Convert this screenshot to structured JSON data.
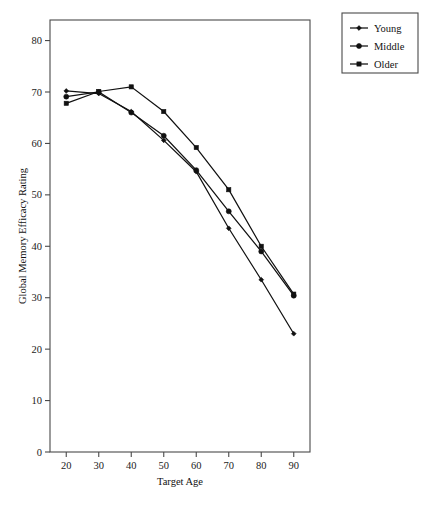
{
  "chart_data": {
    "type": "line",
    "title": "",
    "xlabel": "Target Age",
    "ylabel": "Global Memory Efficacy Rating",
    "x": [
      20,
      30,
      40,
      50,
      60,
      70,
      80,
      90
    ],
    "xlim": [
      15,
      95
    ],
    "ylim": [
      0,
      84
    ],
    "xticks": [
      "20",
      "30",
      "40",
      "50",
      "60",
      "70",
      "80",
      "90"
    ],
    "yticks": [
      "0",
      "10",
      "20",
      "30",
      "40",
      "50",
      "60",
      "70",
      "80"
    ],
    "ytick_values": [
      0,
      10,
      20,
      30,
      40,
      50,
      60,
      70,
      80
    ],
    "grid": false,
    "legend_position": "outside-top-right",
    "series": [
      {
        "name": "Young",
        "marker": "diamond",
        "color": "#111111",
        "values": [
          70.2,
          69.7,
          66.2,
          60.6,
          54.5,
          43.5,
          33.5,
          23.0
        ]
      },
      {
        "name": "Middle",
        "marker": "circle",
        "color": "#111111",
        "values": [
          69.1,
          70.0,
          66.0,
          61.5,
          54.8,
          46.8,
          39.0,
          30.4
        ]
      },
      {
        "name": "Older",
        "marker": "square",
        "color": "#111111",
        "values": [
          67.8,
          70.1,
          71.0,
          66.2,
          59.2,
          51.0,
          40.0,
          30.7
        ]
      }
    ]
  },
  "legend": {
    "entries": [
      {
        "label": "Young"
      },
      {
        "label": "Middle"
      },
      {
        "label": "Older"
      }
    ]
  }
}
